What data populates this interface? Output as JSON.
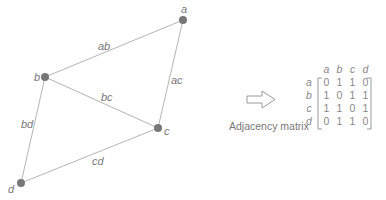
{
  "graph": {
    "nodes": [
      {
        "id": "a",
        "label": "a",
        "x": 183,
        "y": 20
      },
      {
        "id": "b",
        "label": "b",
        "x": 45,
        "y": 77
      },
      {
        "id": "c",
        "label": "c",
        "x": 158,
        "y": 128
      },
      {
        "id": "d",
        "label": "d",
        "x": 21,
        "y": 183
      }
    ],
    "edges": [
      {
        "id": "ab",
        "label": "ab"
      },
      {
        "id": "ac",
        "label": "ac"
      },
      {
        "id": "bc",
        "label": "bc"
      },
      {
        "id": "bd",
        "label": "bd"
      },
      {
        "id": "cd",
        "label": "cd"
      }
    ],
    "colors": {
      "node": "#777777",
      "edge": "#b5b5b5",
      "text": "#777777"
    }
  },
  "arrow": {
    "icon": "right-arrow-icon"
  },
  "caption": "Adjacency matrix",
  "matrix": {
    "col_headers": [
      "a",
      "b",
      "c",
      "d"
    ],
    "rows": [
      {
        "label": "a",
        "values": [
          "0",
          "1",
          "1",
          "0"
        ]
      },
      {
        "label": "b",
        "values": [
          "1",
          "0",
          "1",
          "1"
        ]
      },
      {
        "label": "c",
        "values": [
          "1",
          "1",
          "0",
          "1"
        ]
      },
      {
        "label": "d",
        "values": [
          "0",
          "1",
          "1",
          "0"
        ]
      }
    ]
  }
}
